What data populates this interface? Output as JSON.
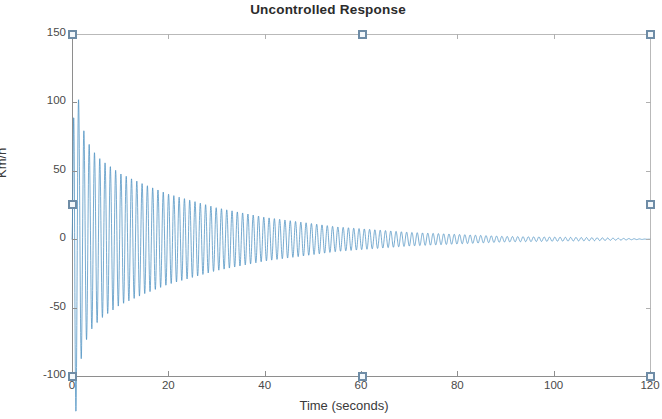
{
  "figure": {
    "width": 662,
    "height": 419,
    "background": "#ffffff",
    "state": "axes-selected"
  },
  "chart_data": {
    "type": "line",
    "title": "Uncontrolled Response",
    "xlabel": "Time (seconds)",
    "ylabel": "Km/h",
    "xlim": [
      0,
      120
    ],
    "ylim": [
      -100,
      150
    ],
    "xticks": [
      0,
      20,
      40,
      60,
      80,
      100,
      120
    ],
    "xticklabels": [
      "0",
      "20",
      "40",
      "60",
      "80",
      "100",
      "120"
    ],
    "yticks": [
      -100,
      -50,
      0,
      50,
      100,
      150
    ],
    "yticklabels": [
      "-100",
      "-50",
      "0",
      "50",
      "100",
      "150"
    ],
    "grid": false,
    "legend": null,
    "line_color": "#4a8fc0",
    "line_width": 0.8,
    "model": {
      "form": "A * exp(-t/tau) * sin(omega*t)",
      "amplitude": 150,
      "tau": 19.5,
      "omega": 5.72,
      "phase": 0.0,
      "samples": 4200
    },
    "envelope_points": [
      {
        "t": 0.5,
        "peak": 140
      },
      {
        "t": 1.6,
        "peak": 92
      },
      {
        "t": 2.7,
        "peak": 76
      },
      {
        "t": 4.0,
        "peak": 66
      },
      {
        "t": 6.0,
        "peak": 58
      },
      {
        "t": 10.0,
        "peak": 48
      },
      {
        "t": 15.0,
        "peak": 40
      },
      {
        "t": 20.0,
        "peak": 33
      },
      {
        "t": 30.0,
        "peak": 23
      },
      {
        "t": 40.0,
        "peak": 16
      },
      {
        "t": 55.0,
        "peak": 9
      },
      {
        "t": 70.0,
        "peak": 5
      },
      {
        "t": 90.0,
        "peak": 2
      },
      {
        "t": 110.0,
        "peak": 1
      },
      {
        "t": 120.0,
        "peak": 0
      }
    ]
  },
  "selection_handles": [
    {
      "name": "handle-top-left",
      "x": 72,
      "y": 34
    },
    {
      "name": "handle-top-center",
      "x": 362,
      "y": 34
    },
    {
      "name": "handle-top-right",
      "x": 650,
      "y": 34
    },
    {
      "name": "handle-middle-left",
      "x": 72,
      "y": 204
    },
    {
      "name": "handle-middle-right",
      "x": 650,
      "y": 204
    },
    {
      "name": "handle-bottom-left",
      "x": 72,
      "y": 376
    },
    {
      "name": "handle-bottom-center",
      "x": 362,
      "y": 376
    },
    {
      "name": "handle-bottom-right",
      "x": 650,
      "y": 376
    }
  ],
  "colors": {
    "line": "#4a8fc0",
    "axis": "#8e8e8e",
    "tick_text": "#4a4a4a",
    "title_text": "#2b2b2b",
    "handle_border": "#6e8ca6",
    "handle_fill": "#f4f8fb"
  }
}
